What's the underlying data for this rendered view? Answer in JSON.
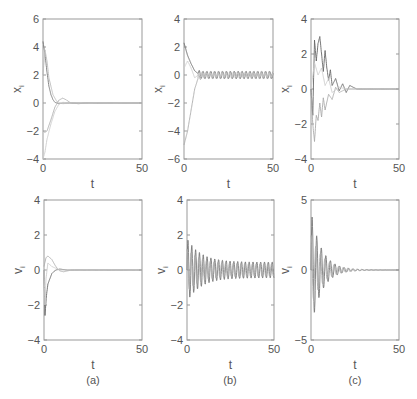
{
  "chart_data": [
    {
      "id": "a_x",
      "panel": "(a)",
      "type": "line",
      "ylabel": "x_i",
      "xlabel": "t",
      "xlim": [
        0,
        50
      ],
      "ylim": [
        -4,
        6
      ],
      "yticks": [
        -4,
        -2,
        0,
        2,
        4,
        6
      ],
      "xticks": [
        0,
        50
      ],
      "box": [
        43,
        19,
        142,
        159
      ],
      "series": [
        {
          "name": "x1",
          "color": "#777",
          "points": [
            [
              0,
              4.4
            ],
            [
              1,
              3.5
            ],
            [
              2,
              2.2
            ],
            [
              3,
              1.2
            ],
            [
              4,
              0.6
            ],
            [
              5,
              0.25
            ],
            [
              6,
              0.05
            ],
            [
              8,
              -0.05
            ],
            [
              10,
              0
            ],
            [
              14,
              0
            ],
            [
              50,
              0
            ]
          ]
        },
        {
          "name": "x2",
          "color": "#aaa",
          "points": [
            [
              0,
              -2.0
            ],
            [
              1,
              -2.1
            ],
            [
              2,
              -2.0
            ],
            [
              4,
              -1.2
            ],
            [
              6,
              -0.3
            ],
            [
              8,
              0.2
            ],
            [
              10,
              0.35
            ],
            [
              12,
              0.2
            ],
            [
              14,
              0
            ],
            [
              18,
              -0.05
            ],
            [
              22,
              0
            ],
            [
              50,
              0
            ]
          ]
        },
        {
          "name": "x3",
          "color": "#ccc",
          "points": [
            [
              0,
              -4.0
            ],
            [
              1,
              -3.5
            ],
            [
              2,
              -2.6
            ],
            [
              4,
              -1.5
            ],
            [
              6,
              -0.6
            ],
            [
              8,
              -0.1
            ],
            [
              10,
              0.05
            ],
            [
              14,
              0
            ],
            [
              50,
              0
            ]
          ]
        },
        {
          "name": "x4",
          "color": "#bbb",
          "points": [
            [
              0,
              2.0
            ],
            [
              1,
              3.8
            ],
            [
              2,
              3.0
            ],
            [
              3,
              1.8
            ],
            [
              5,
              0.6
            ],
            [
              7,
              0.1
            ],
            [
              10,
              -0.05
            ],
            [
              14,
              0
            ],
            [
              50,
              0
            ]
          ]
        }
      ]
    },
    {
      "id": "b_x",
      "panel": "(b)",
      "type": "line",
      "ylabel": "x_i",
      "xlabel": "t",
      "xlim": [
        0,
        50
      ],
      "ylim": [
        -6,
        4
      ],
      "yticks": [
        -6,
        -4,
        -2,
        0,
        2,
        4
      ],
      "xticks": [
        0,
        50
      ],
      "box": [
        184,
        19,
        273,
        159
      ],
      "series": [
        {
          "name": "x1",
          "color": "#666",
          "points": [
            [
              0,
              2.3
            ],
            [
              2,
              1.4
            ],
            [
              4,
              0.8
            ],
            [
              6,
              0.3
            ],
            [
              8,
              0.1
            ],
            [
              10,
              0
            ],
            [
              50,
              0
            ]
          ],
          "osc": {
            "start": 8,
            "amp": 0.25,
            "period": 2.2
          }
        },
        {
          "name": "x2",
          "color": "#aaa",
          "points": [
            [
              0,
              -5.0
            ],
            [
              2,
              -4.0
            ],
            [
              4,
              -2.5
            ],
            [
              6,
              -1.0
            ],
            [
              8,
              -0.2
            ],
            [
              10,
              0
            ],
            [
              50,
              0
            ]
          ],
          "osc": {
            "start": 8,
            "amp": 0.25,
            "period": 2.2,
            "phase": 1.1
          }
        },
        {
          "name": "x3",
          "color": "#ccc",
          "points": [
            [
              0,
              0.5
            ],
            [
              2,
              1.0
            ],
            [
              4,
              0.5
            ],
            [
              6,
              -0.2
            ],
            [
              8,
              0
            ],
            [
              50,
              0
            ]
          ],
          "osc": {
            "start": 8,
            "amp": 0.15,
            "period": 2.2,
            "phase": 0.5
          }
        }
      ]
    },
    {
      "id": "c_x",
      "panel": "(c)",
      "type": "line",
      "ylabel": "x_i",
      "xlabel": "t",
      "xlim": [
        0,
        50
      ],
      "ylim": [
        -4,
        4
      ],
      "yticks": [
        -4,
        -2,
        0,
        2,
        4
      ],
      "xticks": [
        0,
        50
      ],
      "box": [
        311,
        19,
        399,
        159
      ],
      "series": [
        {
          "name": "x1",
          "color": "#666",
          "points": [
            [
              0,
              0
            ],
            [
              1,
              -1.5
            ],
            [
              2,
              2.8
            ],
            [
              3,
              1.6
            ],
            [
              4,
              2.6
            ],
            [
              5,
              3.0
            ],
            [
              6,
              2.0
            ],
            [
              7,
              1.0
            ],
            [
              8,
              2.2
            ],
            [
              9,
              1.2
            ],
            [
              10,
              0.5
            ],
            [
              11,
              1.1
            ],
            [
              12,
              0.2
            ],
            [
              14,
              0.6
            ],
            [
              16,
              -0.1
            ],
            [
              18,
              0.3
            ],
            [
              20,
              -0.2
            ],
            [
              22,
              0.2
            ],
            [
              26,
              0
            ],
            [
              50,
              0
            ]
          ]
        },
        {
          "name": "x2",
          "color": "#aaa",
          "points": [
            [
              0,
              0
            ],
            [
              1,
              -2.0
            ],
            [
              2,
              -3.0
            ],
            [
              3,
              -1.5
            ],
            [
              4,
              -1.8
            ],
            [
              5,
              -0.8
            ],
            [
              6,
              -1.6
            ],
            [
              7,
              -0.5
            ],
            [
              8,
              -1.2
            ],
            [
              10,
              -0.3
            ],
            [
              12,
              -0.6
            ],
            [
              14,
              0.1
            ],
            [
              16,
              -0.2
            ],
            [
              20,
              0
            ],
            [
              50,
              0
            ]
          ]
        },
        {
          "name": "x3",
          "color": "#ccc",
          "points": [
            [
              0,
              0
            ],
            [
              2,
              1.5
            ],
            [
              4,
              0.8
            ],
            [
              6,
              1.2
            ],
            [
              8,
              0.2
            ],
            [
              10,
              0.6
            ],
            [
              12,
              -0.2
            ],
            [
              16,
              0.1
            ],
            [
              20,
              0
            ],
            [
              50,
              0
            ]
          ]
        }
      ]
    },
    {
      "id": "a_v",
      "panel": "(a)",
      "type": "line",
      "ylabel": "v_i",
      "xlabel": "t",
      "xlim": [
        0,
        50
      ],
      "ylim": [
        -4,
        4
      ],
      "yticks": [
        -4,
        -2,
        0,
        2,
        4
      ],
      "xticks": [
        0,
        50
      ],
      "box": [
        44,
        200,
        142,
        340
      ],
      "series": [
        {
          "name": "v1",
          "color": "#666",
          "points": [
            [
              0,
              0
            ],
            [
              0.5,
              -2.6
            ],
            [
              1.2,
              -1.5
            ],
            [
              2,
              -0.8
            ],
            [
              4,
              -0.2
            ],
            [
              6,
              0
            ],
            [
              8,
              0.05
            ],
            [
              12,
              0
            ],
            [
              50,
              0
            ]
          ]
        },
        {
          "name": "v2",
          "color": "#aaa",
          "points": [
            [
              0,
              0.2
            ],
            [
              1,
              0.7
            ],
            [
              2,
              0.8
            ],
            [
              4,
              0.6
            ],
            [
              6,
              0.2
            ],
            [
              8,
              -0.05
            ],
            [
              10,
              -0.1
            ],
            [
              14,
              0
            ],
            [
              50,
              0
            ]
          ]
        },
        {
          "name": "v3",
          "color": "#ccc",
          "points": [
            [
              0,
              0
            ],
            [
              0.5,
              -2.0
            ],
            [
              1,
              -0.5
            ],
            [
              2,
              0.4
            ],
            [
              4,
              0.2
            ],
            [
              8,
              0
            ],
            [
              50,
              0
            ]
          ]
        }
      ]
    },
    {
      "id": "b_v",
      "panel": "(b)",
      "type": "line",
      "ylabel": "v_i",
      "xlabel": "t",
      "xlim": [
        0,
        50
      ],
      "ylim": [
        -4,
        4
      ],
      "yticks": [
        -4,
        -2,
        0,
        2,
        4
      ],
      "xticks": [
        0,
        50
      ],
      "box": [
        187,
        200,
        274,
        340
      ],
      "series": [
        {
          "name": "v1",
          "color": "#777",
          "osc": {
            "start": 0,
            "amp0": 1.8,
            "amp": 0.45,
            "decay": 8,
            "period": 2.2
          }
        },
        {
          "name": "v2",
          "color": "#aaa",
          "osc": {
            "start": 0,
            "amp0": 1.2,
            "amp": 0.35,
            "decay": 8,
            "period": 2.2,
            "phase": 1.1
          }
        }
      ]
    },
    {
      "id": "c_v",
      "panel": "(c)",
      "type": "line",
      "ylabel": "v_i",
      "xlabel": "t",
      "xlim": [
        0,
        50
      ],
      "ylim": [
        -5,
        5
      ],
      "yticks": [
        -5,
        0,
        5
      ],
      "xticks": [
        0,
        50
      ],
      "box": [
        311,
        200,
        399,
        340
      ],
      "series": [
        {
          "name": "v1",
          "color": "#777",
          "osc": {
            "start": 0,
            "amp0": 4.2,
            "amp": 0,
            "decay": 6,
            "period": 2.6
          }
        },
        {
          "name": "v2",
          "color": "#aaa",
          "osc": {
            "start": 0,
            "amp0": 2.5,
            "amp": 0,
            "decay": 7,
            "period": 2.6,
            "phase": 1.3
          }
        }
      ]
    }
  ],
  "captions": [
    "(a)",
    "(b)",
    "(c)"
  ],
  "xlabel": "t"
}
